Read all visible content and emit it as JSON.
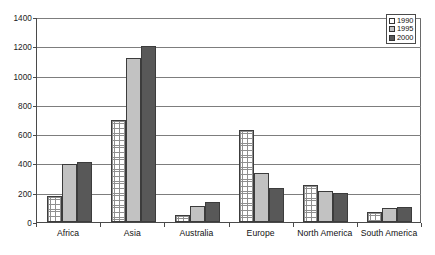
{
  "chart_data": {
    "type": "bar",
    "title": "",
    "subtitle": "",
    "xlabel": "",
    "ylabel": "",
    "categories": [
      "Africa",
      "Asia",
      "Australia",
      "Europe",
      "North America",
      "South America"
    ],
    "series": [
      {
        "name": "1990",
        "color": "#ffffff",
        "pattern": "cross-hatch",
        "values": [
          180,
          700,
          50,
          630,
          255,
          65
        ]
      },
      {
        "name": "1995",
        "color": "#c2c2c2",
        "pattern": "solid",
        "values": [
          395,
          1120,
          110,
          335,
          215,
          95
        ]
      },
      {
        "name": "2000",
        "color": "#585858",
        "pattern": "solid",
        "values": [
          410,
          1200,
          135,
          235,
          200,
          100
        ]
      }
    ],
    "ylim": [
      0,
      1400
    ],
    "yticks": [
      0,
      200,
      400,
      600,
      800,
      1000,
      1200,
      1400
    ],
    "ytick_labels": [
      "0",
      "200",
      "400",
      "600",
      "800",
      "1000",
      "1200",
      "1400"
    ],
    "grid": true,
    "grid_axis": "y",
    "legend": true,
    "legend_position": "top-right",
    "legend_entries": [
      "1990",
      "1995",
      "2000"
    ]
  }
}
